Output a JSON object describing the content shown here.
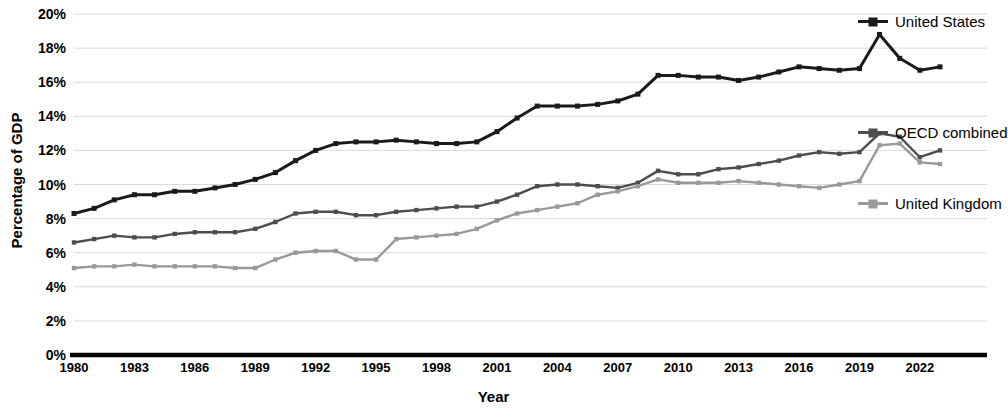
{
  "chart_data": {
    "type": "line",
    "title": "",
    "xlabel": "Year",
    "ylabel": "Percentage of GDP",
    "xlim": [
      1980,
      2023
    ],
    "ylim": [
      0,
      20
    ],
    "ytick_labels": [
      "0%",
      "2%",
      "4%",
      "6%",
      "8%",
      "10%",
      "12%",
      "14%",
      "16%",
      "18%",
      "20%"
    ],
    "ytick_values": [
      0,
      2,
      4,
      6,
      8,
      10,
      12,
      14,
      16,
      18,
      20
    ],
    "xtick_labels": [
      "1980",
      "1983",
      "1986",
      "1989",
      "1992",
      "1995",
      "1998",
      "2001",
      "2004",
      "2007",
      "2010",
      "2013",
      "2016",
      "2019",
      "2022"
    ],
    "xtick_values": [
      1980,
      1983,
      1986,
      1989,
      1992,
      1995,
      1998,
      2001,
      2004,
      2007,
      2010,
      2013,
      2016,
      2019,
      2022
    ],
    "grid": true,
    "legend_position": "right",
    "x": [
      1980,
      1981,
      1982,
      1983,
      1984,
      1985,
      1986,
      1987,
      1988,
      1989,
      1990,
      1991,
      1992,
      1993,
      1994,
      1995,
      1996,
      1997,
      1998,
      1999,
      2000,
      2001,
      2002,
      2003,
      2004,
      2005,
      2006,
      2007,
      2008,
      2009,
      2010,
      2011,
      2012,
      2013,
      2014,
      2015,
      2016,
      2017,
      2018,
      2019,
      2020,
      2021,
      2022,
      2023
    ],
    "series": [
      {
        "name": "United States",
        "color": "#1a1a1a",
        "values": [
          8.3,
          8.6,
          9.1,
          9.4,
          9.4,
          9.6,
          9.6,
          9.8,
          10.0,
          10.3,
          10.7,
          11.4,
          12.0,
          12.4,
          12.5,
          12.5,
          12.6,
          12.5,
          12.4,
          12.4,
          12.5,
          13.1,
          13.9,
          14.6,
          14.6,
          14.6,
          14.7,
          14.9,
          15.3,
          16.4,
          16.4,
          16.3,
          16.3,
          16.1,
          16.3,
          16.6,
          16.9,
          16.8,
          16.7,
          16.8,
          18.8,
          17.4,
          16.7,
          16.9
        ]
      },
      {
        "name": "OECD combined",
        "color": "#4d4d4d",
        "values": [
          6.6,
          6.8,
          7.0,
          6.9,
          6.9,
          7.1,
          7.2,
          7.2,
          7.2,
          7.4,
          7.8,
          8.3,
          8.4,
          8.4,
          8.2,
          8.2,
          8.4,
          8.5,
          8.6,
          8.7,
          8.7,
          9.0,
          9.4,
          9.9,
          10.0,
          10.0,
          9.9,
          9.8,
          10.1,
          10.8,
          10.6,
          10.6,
          10.9,
          11.0,
          11.2,
          11.4,
          11.7,
          11.9,
          11.8,
          11.9,
          13.0,
          12.8,
          11.6,
          12.0
        ]
      },
      {
        "name": "United Kingdom",
        "color": "#999999",
        "values": [
          5.1,
          5.2,
          5.2,
          5.3,
          5.2,
          5.2,
          5.2,
          5.2,
          5.1,
          5.1,
          5.6,
          6.0,
          6.1,
          6.1,
          5.6,
          5.6,
          6.8,
          6.9,
          7.0,
          7.1,
          7.4,
          7.9,
          8.3,
          8.5,
          8.7,
          8.9,
          9.4,
          9.6,
          9.9,
          10.3,
          10.1,
          10.1,
          10.1,
          10.2,
          10.1,
          10.0,
          9.9,
          9.8,
          10.0,
          10.2,
          12.3,
          12.4,
          11.3,
          11.2
        ]
      }
    ]
  },
  "axes": {
    "y_title": "Percentage of GDP",
    "x_title": "Year"
  },
  "legend": [
    {
      "label": "United States",
      "color": "#1a1a1a"
    },
    {
      "label": "OECD combined",
      "color": "#4d4d4d"
    },
    {
      "label": "United Kingdom",
      "color": "#999999"
    }
  ],
  "style": {
    "gridline_color": "#d9d9d9",
    "axis_color": "#000000",
    "background": "#ffffff"
  }
}
